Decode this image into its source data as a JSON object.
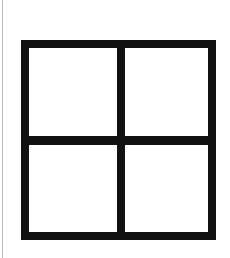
{
  "figure": {
    "description": "A thick black square outline divided into four equal white panes by one vertical and one horizontal black bar forming a cross.",
    "canvas": {
      "width": 230,
      "height": 258,
      "background_color": "#ffffff"
    },
    "colors": {
      "stroke": "#111111",
      "fill": "#ffffff",
      "page_edge_line": "#b9b9b9"
    },
    "shape": {
      "name": "grid-square",
      "kind": "rectangle",
      "x": 21,
      "y": 40,
      "width": 195,
      "height": 200,
      "stroke_width": 8,
      "rows": 2,
      "columns": 2,
      "cells": 4
    },
    "dividers": [
      {
        "name": "vertical-divider",
        "orientation": "vertical",
        "x": 117,
        "y": 40,
        "thickness": 8,
        "length": 200
      },
      {
        "name": "horizontal-divider",
        "orientation": "horizontal",
        "x": 21,
        "y": 136,
        "thickness": 9,
        "length": 195
      }
    ],
    "panes": [
      {
        "name": "pane-top-left",
        "label": "top-left pane",
        "row": 1,
        "column": 1,
        "fill": "#ffffff"
      },
      {
        "name": "pane-top-right",
        "label": "top-right pane",
        "row": 1,
        "column": 2,
        "fill": "#ffffff"
      },
      {
        "name": "pane-bottom-left",
        "label": "bottom-left pane",
        "row": 2,
        "column": 1,
        "fill": "#ffffff"
      },
      {
        "name": "pane-bottom-right",
        "label": "bottom-right pane",
        "row": 2,
        "column": 2,
        "fill": "#ffffff"
      }
    ],
    "page_edge_line": {
      "name": "page-edge-line",
      "x": 2,
      "y": 0,
      "width": 1,
      "height": 258
    }
  }
}
